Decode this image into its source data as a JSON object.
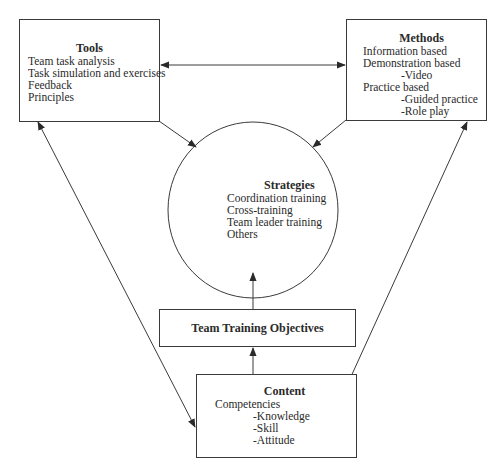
{
  "diagram": {
    "tools": {
      "title": "Tools",
      "items": [
        "Team task analysis",
        "Task simulation and exercises",
        "Feedback",
        "Principles"
      ]
    },
    "methods": {
      "title": "Methods",
      "items": [
        "Information based",
        "Demonstration based",
        "-Video",
        "Practice based",
        "-Guided practice",
        "-Role play"
      ]
    },
    "strategies": {
      "title": "Strategies",
      "items": [
        "Coordination training",
        "Cross-training",
        "Team leader training",
        "Others"
      ]
    },
    "objectives": {
      "title": "Team Training Objectives"
    },
    "content": {
      "title": "Content",
      "items": [
        "Competencies",
        "-Knowledge",
        "-Skill",
        "-Attitude"
      ]
    },
    "connections": [
      {
        "from": "tools",
        "to": "methods",
        "type": "bidirectional"
      },
      {
        "from": "tools",
        "to": "strategies",
        "type": "directed"
      },
      {
        "from": "methods",
        "to": "strategies",
        "type": "directed"
      },
      {
        "from": "objectives",
        "to": "strategies",
        "type": "directed"
      },
      {
        "from": "content",
        "to": "objectives",
        "type": "directed"
      },
      {
        "from": "tools",
        "to": "content",
        "type": "bidirectional"
      },
      {
        "from": "methods",
        "to": "content",
        "type": "bidirectional"
      }
    ],
    "colors": {
      "stroke": "#3a3a3a",
      "text": "#2a2a2a",
      "background": "#ffffff"
    }
  }
}
